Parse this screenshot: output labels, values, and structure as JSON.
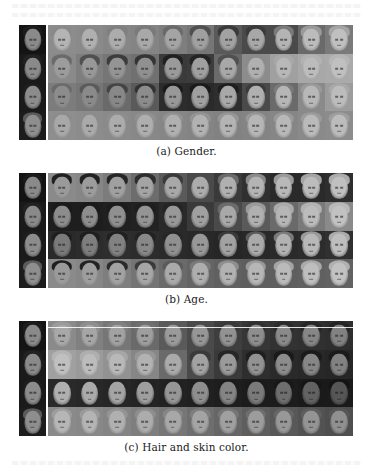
{
  "figure": {
    "panels": [
      {
        "id": "a",
        "caption": "(a) Gender.",
        "top": 25,
        "caption_top": 145,
        "rows": [
          {
            "source": {
              "bg": "#141414",
              "face": "#8a8a8a",
              "hair": "#1c1c1c"
            },
            "bg": [
              "#8c8c8c",
              "#8a8a8a",
              "#868686",
              "#848484",
              "#7e7e7e",
              "#767676",
              "#5a5a5a",
              "#4a4a4a",
              "#4a4a4a",
              "#6a6a6a",
              "#7a7a7a"
            ],
            "face": [
              "#b4b4b4",
              "#b0b0b0",
              "#acacac",
              "#a8a8a8",
              "#a4a4a4",
              "#a0a0a0",
              "#a2a2a2",
              "#a8a8a8",
              "#b4b4b4",
              "#bcbcbc",
              "#c0c0c0"
            ],
            "hair": [
              "#8a8a8a",
              "#888888",
              "#808080",
              "#7a7a7a",
              "#6a6a6a",
              "#505050",
              "#3a3a3a",
              "#3a3a3a",
              "#7a7a7a",
              "#9a9a9a",
              "#a4a4a4"
            ]
          },
          {
            "source": {
              "bg": "#1a1a1a",
              "face": "#8a8a8a",
              "hair": "#222222"
            },
            "bg": [
              "#8a8a8a",
              "#7e7e7e",
              "#767676",
              "#707070",
              "#3a3a3a",
              "#3c3c3c",
              "#6a6a6a",
              "#8c8c8c",
              "#a0a0a0",
              "#a8a8a8",
              "#aaaaaa"
            ],
            "face": [
              "#9c9c9c",
              "#989898",
              "#949494",
              "#909090",
              "#9a9a9a",
              "#a0a0a0",
              "#a8a8a8",
              "#b0b0b0",
              "#b8b8b8",
              "#bcbcbc",
              "#c0c0c0"
            ],
            "hair": [
              "#6a6a6a",
              "#505050",
              "#3c3c3c",
              "#343434",
              "#202020",
              "#242424",
              "#505050",
              "#8a8a8a",
              "#a8a8a8",
              "#b2b2b2",
              "#b6b6b6"
            ]
          },
          {
            "source": {
              "bg": "#1a1a1a",
              "face": "#8c8c8c",
              "hair": "#1e1e1e"
            },
            "bg": [
              "#7c7c7c",
              "#767676",
              "#6a6a6a",
              "#5a5a5a",
              "#2c2c2c",
              "#2a2a2a",
              "#2e2e2e",
              "#4a4a4a",
              "#6a6a6a",
              "#8a8a8a",
              "#9c9c9c"
            ],
            "face": [
              "#8c8c8c",
              "#8a8a8a",
              "#888888",
              "#8c8c8c",
              "#989898",
              "#a0a0a0",
              "#a8a8a8",
              "#b0b0b0",
              "#b6b6b6",
              "#b8b8b8",
              "#bcbcbc"
            ],
            "hair": [
              "#6a6a6a",
              "#5a5a5a",
              "#444444",
              "#323232",
              "#1a1a1a",
              "#1a1a1a",
              "#1e1e1e",
              "#3a3a3a",
              "#7a7a7a",
              "#9a9a9a",
              "#a8a8a8"
            ]
          },
          {
            "source": {
              "bg": "#1c1c1c",
              "face": "#8e8e8e",
              "hair": "#5a5a5a"
            },
            "bg": [
              "#8e8e8e",
              "#8c8c8c",
              "#8a8a8a",
              "#888888",
              "#868686",
              "#848484",
              "#828282",
              "#848484",
              "#868686",
              "#8a8a8a",
              "#8c8c8c"
            ],
            "face": [
              "#a8a8a8",
              "#aaaaaa",
              "#acacac",
              "#aeaeae",
              "#b0b0b0",
              "#b2b2b2",
              "#b4b4b4",
              "#b6b6b6",
              "#b8b8b8",
              "#bababa",
              "#bcbcbc"
            ],
            "hair": [
              "#8c8c8c",
              "#8c8c8c",
              "#8e8e8e",
              "#909090",
              "#929292",
              "#949494",
              "#969696",
              "#989898",
              "#9a9a9a",
              "#9c9c9c",
              "#9e9e9e"
            ]
          }
        ]
      },
      {
        "id": "b",
        "caption": "(b) Age.",
        "top": 173,
        "caption_top": 293,
        "rows": [
          {
            "source": {
              "bg": "#141414",
              "face": "#8a8a8a",
              "hair": "#1c1c1c"
            },
            "bg": [
              "#8a8a8a",
              "#868686",
              "#7c7c7c",
              "#6c6c6c",
              "#5a5a5a",
              "#4a4a4a",
              "#3a3a3a",
              "#303030",
              "#2a2a2a",
              "#2a2a2a",
              "#2e2e2e"
            ],
            "face": [
              "#9a9a9a",
              "#9c9c9c",
              "#a0a0a0",
              "#a4a4a4",
              "#a8a8a8",
              "#acacac",
              "#b0b0b0",
              "#b4b4b4",
              "#b8b8b8",
              "#bcbcbc",
              "#c0c0c0"
            ],
            "hair": [
              "#202020",
              "#222222",
              "#262626",
              "#2e2e2e",
              "#3a3a3a",
              "#4a4a4a",
              "#6a6a6a",
              "#8a8a8a",
              "#9a9a9a",
              "#a4a4a4",
              "#acacac"
            ]
          },
          {
            "source": {
              "bg": "#1a1a1a",
              "face": "#8a8a8a",
              "hair": "#222222"
            },
            "bg": [
              "#1e1e1e",
              "#1e1e1e",
              "#202020",
              "#222222",
              "#2a2a2a",
              "#3a3a3a",
              "#4a4a4a",
              "#5a5a5a",
              "#6a6a6a",
              "#7a7a7a",
              "#8a8a8a"
            ],
            "face": [
              "#8c8c8c",
              "#8e8e8e",
              "#909090",
              "#949494",
              "#989898",
              "#a0a0a0",
              "#a8a8a8",
              "#b0b0b0",
              "#b6b6b6",
              "#bcbcbc",
              "#c2c2c2"
            ],
            "hair": [
              "#1a1a1a",
              "#1a1a1a",
              "#1c1c1c",
              "#1e1e1e",
              "#242424",
              "#3a3a3a",
              "#6a6a6a",
              "#9a9a9a",
              "#aaaaaa",
              "#b2b2b2",
              "#b8b8b8"
            ]
          },
          {
            "source": {
              "bg": "#1a1a1a",
              "face": "#8c8c8c",
              "hair": "#1e1e1e"
            },
            "bg": [
              "#2a2a2a",
              "#2c2c2c",
              "#2e2e2e",
              "#2c2c2c",
              "#2a2a2a",
              "#282828",
              "#262626",
              "#282828",
              "#2a2a2a",
              "#2c2c2c",
              "#303030"
            ],
            "face": [
              "#7a7a7a",
              "#7e7e7e",
              "#828282",
              "#888888",
              "#909090",
              "#989898",
              "#a2a2a2",
              "#aaaaaa",
              "#b2b2b2",
              "#b8b8b8",
              "#bebebe"
            ],
            "hair": [
              "#1e1e1e",
              "#1e1e1e",
              "#202020",
              "#222222",
              "#262626",
              "#2a2a2a",
              "#3a3a3a",
              "#5a5a5a",
              "#7a7a7a",
              "#9a9a9a",
              "#aaaaaa"
            ]
          },
          {
            "source": {
              "bg": "#1c1c1c",
              "face": "#8e8e8e",
              "hair": "#5a5a5a"
            },
            "bg": [
              "#8a8a8a",
              "#868686",
              "#7e7e7e",
              "#747474",
              "#6a6a6a",
              "#646464",
              "#606060",
              "#5e5e5e",
              "#5e5e5e",
              "#606060",
              "#626262"
            ],
            "face": [
              "#9a9a9a",
              "#9e9e9e",
              "#a2a2a2",
              "#a6a6a6",
              "#aaaaaa",
              "#aeaeae",
              "#b2b2b2",
              "#b6b6b6",
              "#bababa",
              "#bebebe",
              "#c2c2c2"
            ],
            "hair": [
              "#1e1e1e",
              "#222222",
              "#2a2a2a",
              "#3a3a3a",
              "#5a5a5a",
              "#7a7a7a",
              "#8e8e8e",
              "#9a9a9a",
              "#a4a4a4",
              "#aaaaaa",
              "#b0b0b0"
            ]
          }
        ]
      },
      {
        "id": "c",
        "caption": "(c) Hair and skin color.",
        "top": 321,
        "caption_top": 441,
        "white_line_row": 0,
        "rows": [
          {
            "source": {
              "bg": "#141414",
              "face": "#8a8a8a",
              "hair": "#1c1c1c"
            },
            "bg": [
              "#8a8a8a",
              "#808080",
              "#767676",
              "#6a6a6a",
              "#5a5a5a",
              "#4a4a4a",
              "#3e3e3e",
              "#363636",
              "#323232",
              "#303030",
              "#2e2e2e"
            ],
            "face": [
              "#a8a8a8",
              "#a6a6a6",
              "#a2a2a2",
              "#9e9e9e",
              "#9a9a9a",
              "#969696",
              "#929292",
              "#8e8e8e",
              "#8a8a8a",
              "#868686",
              "#828282"
            ],
            "hair": [
              "#9a9a9a",
              "#8e8e8e",
              "#808080",
              "#707070",
              "#5a5a5a",
              "#4a4a4a",
              "#3a3a3a",
              "#303030",
              "#2a2a2a",
              "#262626",
              "#242424"
            ]
          },
          {
            "source": {
              "bg": "#1a1a1a",
              "face": "#8a8a8a",
              "hair": "#222222"
            },
            "bg": [
              "#a0a0a0",
              "#9a9a9a",
              "#929292",
              "#868686",
              "#6a6a6a",
              "#4a4a4a",
              "#3a3a3a",
              "#2e2e2e",
              "#2a2a2a",
              "#282828",
              "#262626"
            ],
            "face": [
              "#c0c0c0",
              "#bcbcbc",
              "#b8b8b8",
              "#b2b2b2",
              "#aaaaaa",
              "#a2a2a2",
              "#9a9a9a",
              "#929292",
              "#8c8c8c",
              "#868686",
              "#828282"
            ],
            "hair": [
              "#b4b4b4",
              "#aeaeae",
              "#a6a6a6",
              "#969696",
              "#6a6a6a",
              "#3a3a3a",
              "#262626",
              "#1e1e1e",
              "#1a1a1a",
              "#1a1a1a",
              "#1a1a1a"
            ]
          },
          {
            "source": {
              "bg": "#1a1a1a",
              "face": "#8c8c8c",
              "hair": "#1e1e1e"
            },
            "bg": [
              "#2a2a2a",
              "#282828",
              "#262626",
              "#242424",
              "#222222",
              "#202020",
              "#1e1e1e",
              "#1c1c1c",
              "#1c1c1c",
              "#1a1a1a",
              "#1a1a1a"
            ],
            "face": [
              "#b0b0b0",
              "#aaaaaa",
              "#a4a4a4",
              "#9e9e9e",
              "#969696",
              "#8e8e8e",
              "#848484",
              "#7a7a7a",
              "#6e6e6e",
              "#626262",
              "#565656"
            ],
            "hair": [
              "#2a2a2a",
              "#262626",
              "#242424",
              "#222222",
              "#202020",
              "#1e1e1e",
              "#1c1c1c",
              "#1a1a1a",
              "#181818",
              "#161616",
              "#141414"
            ]
          },
          {
            "source": {
              "bg": "#1c1c1c",
              "face": "#8e8e8e",
              "hair": "#5a5a5a"
            },
            "bg": [
              "#8a8a8a",
              "#888888",
              "#848484",
              "#7e7e7e",
              "#767676",
              "#6e6e6e",
              "#666666",
              "#5e5e5e",
              "#585858",
              "#525252",
              "#4e4e4e"
            ],
            "face": [
              "#b6b6b6",
              "#b4b4b4",
              "#b0b0b0",
              "#acacac",
              "#a8a8a8",
              "#a4a4a4",
              "#a0a0a0",
              "#9c9c9c",
              "#989898",
              "#949494",
              "#909090"
            ],
            "hair": [
              "#9e9e9e",
              "#9a9a9a",
              "#949494",
              "#8e8e8e",
              "#868686",
              "#7e7e7e",
              "#767676",
              "#6e6e6e",
              "#666666",
              "#5e5e5e",
              "#565656"
            ]
          }
        ]
      }
    ]
  }
}
